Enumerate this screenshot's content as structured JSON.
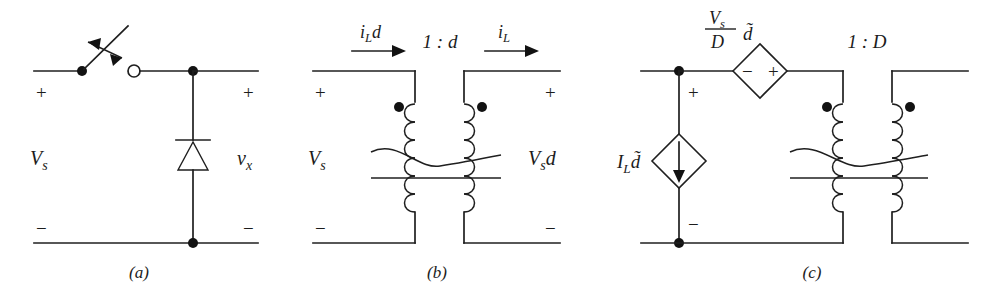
{
  "figure": {
    "type": "circuit-diagram",
    "background_color": "#ffffff",
    "line_color": "#1f1f1f",
    "panels": [
      {
        "id": "a",
        "caption": "(a)",
        "input_label": "Vs",
        "input_label_base": "V",
        "input_label_sub": "s",
        "output_label_base": "v",
        "output_label_sub": "x",
        "polarity_top_left": "+",
        "polarity_bottom_left": "−",
        "polarity_top_right": "+",
        "polarity_bottom_right": "−",
        "components": [
          "spst-switch",
          "open-terminal",
          "diode",
          "node-dot"
        ]
      },
      {
        "id": "b",
        "caption": "(b)",
        "input_label_base": "V",
        "input_label_sub": "s",
        "output_label_base": "V",
        "output_label_sub": "s",
        "output_label_tail": "d",
        "current_left_base": "i",
        "current_left_sub": "L",
        "current_left_tail": "d",
        "current_right_base": "i",
        "current_right_sub": "L",
        "turns_ratio": "1 : d",
        "polarity_top_left": "+",
        "polarity_bottom_left": "−",
        "polarity_top_right": "+",
        "polarity_bottom_right": "−",
        "components": [
          "ideal-transformer",
          "polarity-dots",
          "current-arrows"
        ]
      },
      {
        "id": "c",
        "caption": "(c)",
        "vsource_num_base": "V",
        "vsource_num_sub": "s",
        "vsource_den": "D",
        "vsource_tail": "d̃",
        "vsource_minus": "−",
        "vsource_plus": "+",
        "isource_base": "I",
        "isource_sub": "L",
        "isource_tail": "d̃",
        "turns_ratio": "1 : D",
        "polarity_top": "+",
        "polarity_bottom": "−",
        "components": [
          "dependent-voltage-source",
          "dependent-current-source",
          "ideal-transformer",
          "polarity-dots",
          "node-dots"
        ]
      }
    ]
  }
}
